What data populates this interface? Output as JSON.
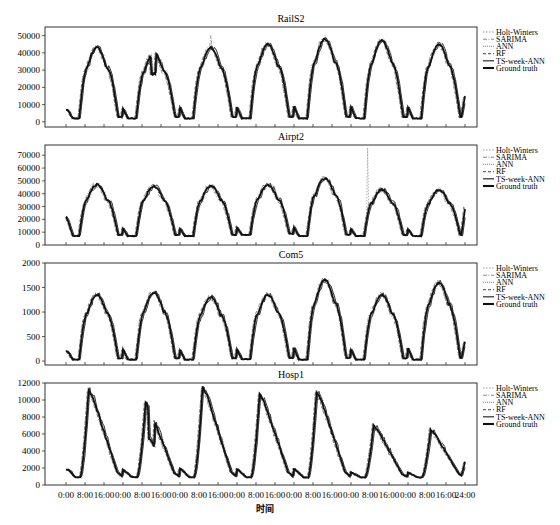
{
  "chart_data": [
    {
      "type": "line",
      "title": "RailS2",
      "xlabel": "",
      "ylabel": "",
      "ylim": [
        -3000,
        55000
      ],
      "yticks": [
        0,
        10000,
        20000,
        30000,
        40000,
        50000
      ],
      "days": 7,
      "daily_peak_ground_truth": [
        43000,
        40000,
        43000,
        45000,
        48000,
        47000,
        45000
      ],
      "daily_min_ground_truth": [
        2000,
        2000,
        2000,
        2000,
        2000,
        2000,
        2000
      ],
      "start_value": 7000,
      "end_value": 15000,
      "annotations": [
        "SARIMA spike ~50000 at day 3 and day 5",
        "dip to ~22000 midday day 2"
      ],
      "series": [
        {
          "name": "Holt-Winters",
          "style": "dotted"
        },
        {
          "name": "SARIMA",
          "style": "dash-dot"
        },
        {
          "name": "ANN",
          "style": "dotted-fine"
        },
        {
          "name": "RF",
          "style": "dashed"
        },
        {
          "name": "TS-week-ANN",
          "style": "solid"
        },
        {
          "name": "Ground truth",
          "style": "solid-bold"
        }
      ],
      "legend_position": "right"
    },
    {
      "type": "line",
      "title": "Airpt2",
      "ylim": [
        0,
        78000
      ],
      "yticks": [
        0,
        10000,
        20000,
        30000,
        40000,
        50000,
        60000,
        70000
      ],
      "days": 7,
      "daily_peak_ground_truth": [
        47000,
        46000,
        46000,
        47000,
        52000,
        43000,
        43000
      ],
      "daily_min_ground_truth": [
        7000,
        7000,
        7000,
        8000,
        7000,
        7000,
        7000
      ],
      "start_value": 22000,
      "end_value": 28000,
      "annotations": [
        "Holt-Winters spike ~76000 on day 6"
      ],
      "series": [
        {
          "name": "Holt-Winters",
          "style": "dotted"
        },
        {
          "name": "SARIMA",
          "style": "dash-dot"
        },
        {
          "name": "ANN",
          "style": "dotted-fine"
        },
        {
          "name": "RF",
          "style": "dashed"
        },
        {
          "name": "TS-week-ANN",
          "style": "solid"
        },
        {
          "name": "Ground truth",
          "style": "solid-bold"
        }
      ],
      "legend_position": "right"
    },
    {
      "type": "line",
      "title": "Com5",
      "ylim": [
        -80,
        2000
      ],
      "yticks": [
        0,
        500,
        1000,
        1500,
        2000
      ],
      "days": 7,
      "daily_peak_ground_truth": [
        1350,
        1400,
        1300,
        1350,
        1650,
        1350,
        1600
      ],
      "daily_min_ground_truth": [
        30,
        30,
        30,
        40,
        30,
        30,
        30
      ],
      "start_value": 200,
      "end_value": 400,
      "series": [
        {
          "name": "Holt-Winters",
          "style": "dotted"
        },
        {
          "name": "SARIMA",
          "style": "dash-dot"
        },
        {
          "name": "ANN",
          "style": "dotted-fine"
        },
        {
          "name": "RF",
          "style": "dashed"
        },
        {
          "name": "TS-week-ANN",
          "style": "solid"
        },
        {
          "name": "Ground truth",
          "style": "solid-bold"
        }
      ],
      "legend_position": "right"
    },
    {
      "type": "line",
      "title": "Hosp1",
      "xlabel": "时间",
      "ylim": [
        0,
        12000
      ],
      "yticks": [
        0,
        2000,
        4000,
        6000,
        8000,
        10000,
        12000
      ],
      "days": 7,
      "daily_peak_ground_truth": [
        11200,
        9700,
        11500,
        10700,
        11000,
        7000,
        6500
      ],
      "daily_min_ground_truth": [
        900,
        900,
        900,
        900,
        900,
        900,
        900
      ],
      "start_value": 1800,
      "end_value": 2700,
      "xticks": [
        "0:00",
        "8:00",
        "16:00",
        "0:00",
        "8:00",
        "16:00",
        "0:00",
        "8:00",
        "16:00",
        "0:00",
        "8:00",
        "16:00",
        "0:00",
        "8:00",
        "16:00",
        "0:00",
        "8:00",
        "16:00",
        "0:00",
        "8:00",
        "16:00",
        "24:00"
      ],
      "series": [
        {
          "name": "Holt-Winters",
          "style": "dotted"
        },
        {
          "name": "SARIMA",
          "style": "dash-dot"
        },
        {
          "name": "ANN",
          "style": "dotted-fine"
        },
        {
          "name": "RF",
          "style": "dashed"
        },
        {
          "name": "TS-week-ANN",
          "style": "solid"
        },
        {
          "name": "Ground truth",
          "style": "solid-bold"
        }
      ],
      "legend_position": "right"
    }
  ],
  "figure": {
    "panel_titles": [
      "RailS2",
      "Airpt2",
      "Com5",
      "Hosp1"
    ],
    "legend": [
      "Holt-Winters",
      "SARIMA",
      "ANN",
      "RF",
      "TS-week-ANN",
      "Ground truth"
    ],
    "xlabel": "时间",
    "xtick_labels": [
      "0:00",
      "8:00",
      "16:00",
      "0:00",
      "8:00",
      "16:00",
      "0:00",
      "8:00",
      "16:00",
      "0:00",
      "8:00",
      "16:00",
      "0:00",
      "8:00",
      "16:00",
      "0:00",
      "8:00",
      "16:00",
      "0:00",
      "8:00",
      "16:00",
      "24:00"
    ]
  }
}
